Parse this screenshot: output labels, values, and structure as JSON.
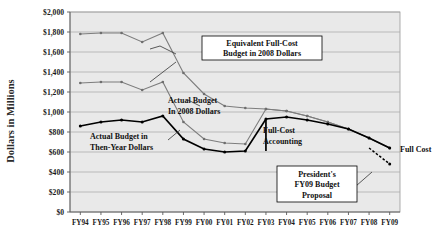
{
  "chart_data": {
    "type": "line",
    "title": "",
    "xlabel": "",
    "ylabel": "Dollars in Millions",
    "ylim": [
      0,
      2000
    ],
    "ytick_step": 200,
    "grid": true,
    "legend_position": "none",
    "categories": [
      "FY94",
      "FY95",
      "FY96",
      "FY97",
      "FY98",
      "FY99",
      "FY00",
      "FY01",
      "FY02",
      "FY03",
      "FY04",
      "FY05",
      "FY06",
      "FY07",
      "FY08",
      "FY09"
    ],
    "ytick_labels": [
      "$0",
      "$200",
      "$400",
      "$600",
      "$800",
      "$1,000",
      "$1,200",
      "$1,400",
      "$1,600",
      "$1,800",
      "$2,000"
    ],
    "series": [
      {
        "name": "Equivalent Full-Cost Budget in 2008 Dollars",
        "color": "#7d7d7d",
        "style": "solid",
        "values": [
          1780,
          1790,
          1790,
          1700,
          1790,
          1390,
          1180,
          1060,
          1040,
          1030,
          1010,
          960,
          900,
          830,
          740,
          640
        ]
      },
      {
        "name": "Actual Budget In 2008 Dollars",
        "color": "#7d7d7d",
        "style": "solid",
        "values": [
          1290,
          1300,
          1300,
          1220,
          1300,
          900,
          730,
          690,
          680,
          1030,
          1010,
          960,
          900,
          830,
          740,
          640
        ]
      },
      {
        "name": "Actual Budget in Then-Year Dollars",
        "color": "#000000",
        "style": "solid",
        "values": [
          860,
          900,
          920,
          900,
          960,
          730,
          630,
          600,
          610,
          930,
          950,
          920,
          880,
          830,
          740,
          640
        ]
      },
      {
        "name": "President's FY09 Budget Proposal",
        "color": "#000000",
        "style": "dashed",
        "values": [
          null,
          null,
          null,
          null,
          null,
          null,
          null,
          null,
          null,
          null,
          null,
          null,
          null,
          null,
          640,
          480
        ]
      }
    ],
    "full_cost_accounting_break": {
      "at_category": "FY03",
      "from_value": 610,
      "to_value": 930
    },
    "annotations": [
      {
        "id": "equivalent-full-cost",
        "lines": [
          "Equivalent Full-Cost",
          "Budget in 2008 Dollars"
        ],
        "boxed": true
      },
      {
        "id": "actual-budget-2008",
        "lines": [
          "Actual Budget",
          "In 2008 Dollars"
        ],
        "boxed": false
      },
      {
        "id": "actual-budget-then-year",
        "lines": [
          "Actual Budget in",
          "Then-Year Dollars"
        ],
        "boxed": false
      },
      {
        "id": "full-cost-accounting",
        "lines": [
          "Full-Cost",
          "Accounting"
        ],
        "boxed": false
      },
      {
        "id": "presidents-fy09",
        "lines": [
          "President's",
          "FY09 Budget",
          "Proposal"
        ],
        "boxed": true
      },
      {
        "id": "full-cost",
        "lines": [
          "Full Cost"
        ],
        "boxed": false
      }
    ]
  }
}
